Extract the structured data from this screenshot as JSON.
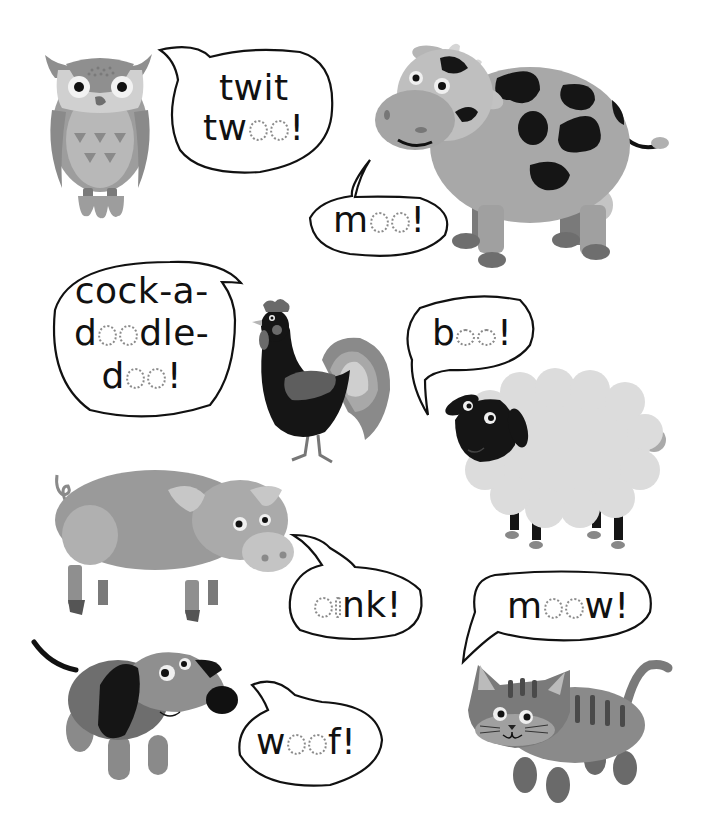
{
  "page": {
    "type": "children's activity worksheet - animal sounds tracing",
    "background": "#ffffff"
  },
  "colors": {
    "outline": "#111111",
    "trace_dots": "#8a8a8a",
    "light_gray": "#c9c9c9",
    "mid_gray": "#9d9d9d",
    "dark_gray": "#6e6e6e",
    "black": "#111111"
  },
  "animals": [
    {
      "name": "owl",
      "sound": {
        "solid": [
          "twit",
          "tw"
        ],
        "traced": [
          "o",
          "o"
        ],
        "end": "!"
      },
      "display": "twit two o!"
    },
    {
      "name": "cow",
      "sound": {
        "solid": "m",
        "traced": [
          "o",
          "o"
        ],
        "end": "!"
      }
    },
    {
      "name": "rooster",
      "sound": {
        "lines": [
          "cock-a-",
          "doodle-",
          "doo!"
        ]
      }
    },
    {
      "name": "sheep",
      "sound": {
        "solid": "b",
        "traced": [
          "a",
          "a"
        ],
        "end": "!"
      }
    },
    {
      "name": "pig",
      "sound": {
        "traced": [
          "o",
          "i"
        ],
        "solid": "nk",
        "end": "!"
      }
    },
    {
      "name": "cat",
      "sound": {
        "solid": "m",
        "traced": [
          "e",
          "o"
        ],
        "solid2": "w",
        "end": "!"
      }
    },
    {
      "name": "dog",
      "sound": {
        "solid": "w",
        "traced": [
          "o",
          "o"
        ],
        "solid2": "f",
        "end": "!"
      }
    }
  ],
  "bubbles": {
    "owl": {
      "line1": "twit",
      "line2_solid": "tw",
      "line2_end": "!"
    },
    "cow": {
      "solid": "m",
      "end": "!"
    },
    "rooster": {
      "line1": "cock-a-",
      "line2_a": "d",
      "line2_b": "dle-",
      "line3_a": "d",
      "line3_end": "!"
    },
    "sheep": {
      "solid": "b",
      "end": "!"
    },
    "pig": {
      "traced_o": "o",
      "traced_i": "i",
      "solid": "nk",
      "end": "!"
    },
    "cat": {
      "solid": "m",
      "solid2": "w",
      "end": "!"
    },
    "dog": {
      "solid": "w",
      "solid2": "f",
      "end": "!"
    }
  }
}
